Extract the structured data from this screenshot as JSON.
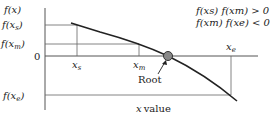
{
  "diagram": {
    "type": "bisection-method-illustration",
    "y_axis_label": "f(x)",
    "x_axis_label": "x value",
    "y_labels": {
      "f_xs": {
        "base": "f(x",
        "sub": "s",
        "end": ")"
      },
      "f_xm": {
        "base": "f(x",
        "sub": "m",
        "end": ")"
      },
      "zero": "0",
      "f_xe": {
        "base": "f(x",
        "sub": "e",
        "end": ")"
      }
    },
    "x_labels": {
      "xs": {
        "base": "x",
        "sub": "s"
      },
      "xm": {
        "base": "x",
        "sub": "m"
      },
      "xe": {
        "base": "x",
        "sub": "e"
      }
    },
    "root_label": "Root",
    "conditions": [
      "f(xs) f(xm) > 0",
      "f(xm) f(xe) < 0"
    ],
    "colors": {
      "curve": "#222222",
      "root_marker": "#888888",
      "lines": "#555555"
    }
  }
}
